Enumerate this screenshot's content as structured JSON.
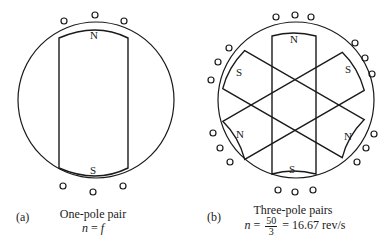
{
  "figure": {
    "panel_a": {
      "tag": "(a)",
      "title": "One-pole pair",
      "formula_lhs": "n",
      "formula_eq": "=",
      "formula_rhs": "f",
      "poles": [
        {
          "label": "N",
          "position": "top"
        },
        {
          "label": "S",
          "position": "bottom"
        }
      ],
      "conductor_groups": 2,
      "conductors_per_group": 3
    },
    "panel_b": {
      "tag": "(b)",
      "title": "Three-pole pairs",
      "formula_lhs": "n",
      "formula_eq1": "=",
      "frac_num": "50",
      "frac_den": "3",
      "formula_eq2": "=",
      "formula_result": "16.67 rev/s",
      "poles": [
        {
          "label": "N",
          "position": "top"
        },
        {
          "label": "S",
          "position": "upper-right"
        },
        {
          "label": "N",
          "position": "lower-right"
        },
        {
          "label": "S",
          "position": "bottom"
        },
        {
          "label": "N",
          "position": "lower-left"
        },
        {
          "label": "S",
          "position": "upper-left"
        }
      ],
      "conductor_groups": 6,
      "conductors_per_group": 3
    },
    "colors": {
      "line": "#1a1a1a",
      "background": "#ffffff"
    }
  }
}
